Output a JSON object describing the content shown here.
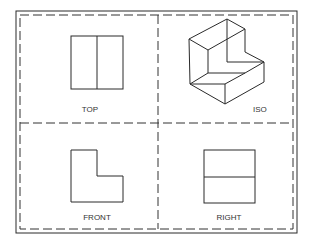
{
  "diagram": {
    "viewports": [
      {
        "id": "top",
        "label": "TOP"
      },
      {
        "id": "iso",
        "label": "ISO"
      },
      {
        "id": "front",
        "label": "FRONT"
      },
      {
        "id": "right",
        "label": "RIGHT"
      }
    ],
    "colors": {
      "line": "#2a2a2a",
      "background": "#ffffff"
    }
  }
}
